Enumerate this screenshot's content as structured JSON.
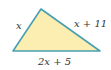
{
  "diagram": {
    "type": "triangle",
    "fill_color": "#fbeeb0",
    "stroke_color": "#4a9fb3",
    "vertices": {
      "top": [
        41,
        9
      ],
      "left": [
        13,
        51
      ],
      "right": [
        100,
        51
      ]
    },
    "labels": {
      "left_side": "x",
      "right_side": "x + 11",
      "bottom_side": "2x + 5"
    }
  }
}
